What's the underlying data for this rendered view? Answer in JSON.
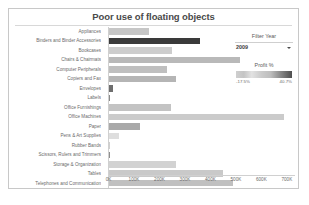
{
  "chart_data": {
    "type": "bar",
    "title": "Poor use of floating objects",
    "orientation": "horizontal",
    "xlabel": "",
    "ylabel": "",
    "xlim": [
      0,
      730000
    ],
    "grid": false,
    "categories": [
      "Appliances",
      "Binders and Binder Accessories",
      "Bookcases",
      "Chairs & Chairmats",
      "Computer Peripherals",
      "Copiers and Fax",
      "Envelopes",
      "Labels",
      "Office Furnishings",
      "Office Machines",
      "Paper",
      "Pens & Art Supplies",
      "Rubber Bands",
      "Scissors, Rulers and Trimmers",
      "Storage & Organization",
      "Tables",
      "Telephones and Communication"
    ],
    "values": [
      160000,
      360000,
      250000,
      515000,
      230000,
      265000,
      18000,
      4000,
      245000,
      690000,
      125000,
      42000,
      1500,
      6000,
      265000,
      450000,
      490000
    ],
    "value_axis_ticks": [
      "0K",
      "100K",
      "200K",
      "300K",
      "400K",
      "500K",
      "600K",
      "700K"
    ],
    "value_axis_tick_values": [
      0,
      100000,
      200000,
      300000,
      400000,
      500000,
      600000,
      700000
    ],
    "color_encoding": "Profit %",
    "bar_colors": [
      "#c6c6c6",
      "#3a3a3a",
      "#cdcdcd",
      "#b9b9b9",
      "#bfbfbf",
      "#b5b5b5",
      "#6e6e6e",
      "#8a8a8a",
      "#c3c3c3",
      "#cbcbcb",
      "#a9a9a9",
      "#dedede",
      "#cfcfcf",
      "#8f8f8f",
      "#d2d2d2",
      "#c9c9c9",
      "#c0c0c0"
    ],
    "series": [
      {
        "name": "Sales",
        "values": [
          160000,
          360000,
          250000,
          515000,
          230000,
          265000,
          18000,
          4000,
          245000,
          690000,
          125000,
          42000,
          1500,
          6000,
          265000,
          450000,
          490000
        ]
      }
    ]
  },
  "filter": {
    "title": "Filter Year",
    "selected_value": "2009",
    "caret_icon": "chevron-down-icon"
  },
  "legend": {
    "title": "Profit %",
    "min_label": "-17.5%",
    "max_label": "40.7%",
    "gradient_from": "#d8d8d8",
    "gradient_to": "#4f4f4f"
  }
}
